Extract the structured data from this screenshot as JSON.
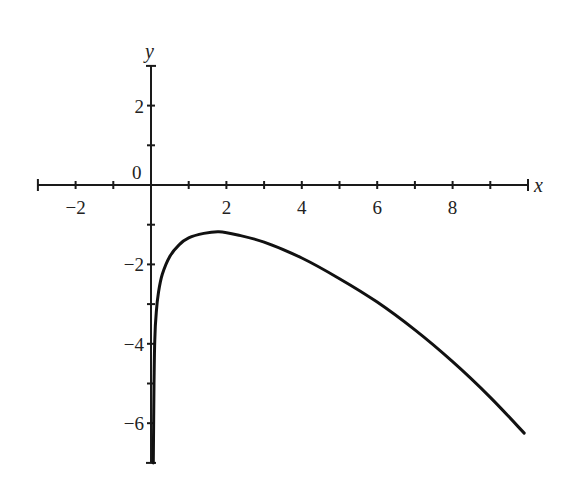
{
  "chart_data": {
    "type": "line",
    "title": "",
    "xlabel": "x",
    "ylabel": "y",
    "xlim": [
      -3,
      10
    ],
    "ylim": [
      -7,
      3
    ],
    "grid": false,
    "origin_label": "0",
    "x_ticks": [
      -3,
      -2,
      -1,
      0,
      1,
      2,
      3,
      4,
      5,
      6,
      7,
      8,
      9,
      10
    ],
    "x_tick_labels": [
      {
        "value": -2,
        "label": "−2"
      },
      {
        "value": 2,
        "label": "2"
      },
      {
        "value": 4,
        "label": "4"
      },
      {
        "value": 6,
        "label": "6"
      },
      {
        "value": 8,
        "label": "8"
      }
    ],
    "y_ticks": [
      -7,
      -6,
      -5,
      -4,
      -3,
      -2,
      -1,
      0,
      1,
      2,
      3
    ],
    "y_tick_labels": [
      {
        "value": 2,
        "label": "2"
      },
      {
        "value": -2,
        "label": "−2"
      },
      {
        "value": -4,
        "label": "−4"
      },
      {
        "value": -6,
        "label": "−6"
      }
    ],
    "series": [
      {
        "name": "curve",
        "x": [
          0.06,
          0.08,
          0.1,
          0.14,
          0.2,
          0.3,
          0.5,
          0.75,
          1.0,
          1.4,
          1.8,
          2.3,
          3.0,
          4.0,
          5.0,
          6.0,
          7.0,
          8.0,
          9.0,
          9.9
        ],
        "y": [
          -7.0,
          -5.0,
          -3.9,
          -3.2,
          -2.7,
          -2.25,
          -1.8,
          -1.5,
          -1.33,
          -1.22,
          -1.18,
          -1.26,
          -1.44,
          -1.84,
          -2.36,
          -2.95,
          -3.65,
          -4.45,
          -5.35,
          -6.25
        ]
      }
    ]
  }
}
